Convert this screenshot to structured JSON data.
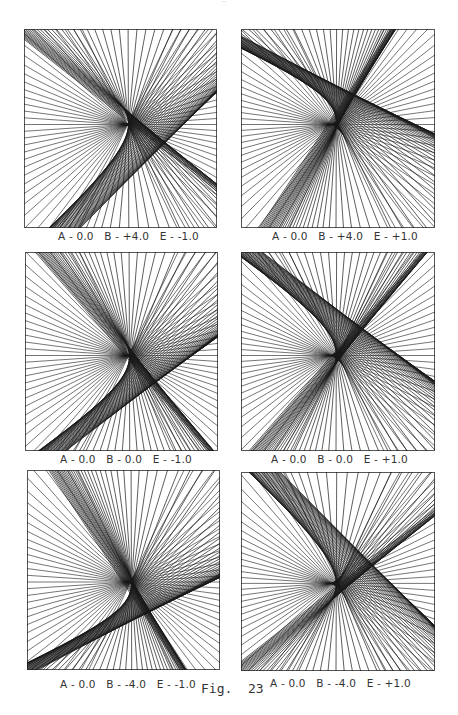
{
  "page_mark": "··",
  "figure_label": "Fig.  23",
  "line_color": "#1a1a1a",
  "panels": [
    {
      "caption": "A - 0.0   B - +4.0   E - -1.0",
      "A": 0.0,
      "B": 4.0,
      "E": -1.0
    },
    {
      "caption": "A - 0.0   B - +4.0   E - +1.0",
      "A": 0.0,
      "B": 4.0,
      "E": 1.0
    },
    {
      "caption": "A - 0.0   B - 0.0   E - -1.0",
      "A": 0.0,
      "B": 0.0,
      "E": -1.0
    },
    {
      "caption": "A - 0.0   B - 0.0   E - +1.0",
      "A": 0.0,
      "B": 0.0,
      "E": 1.0
    },
    {
      "caption": "A - 0.0   B - -4.0   E - -1.0",
      "A": 0.0,
      "B": -4.0,
      "E": -1.0
    },
    {
      "caption": "A - 0.0   B - -4.0   E - +1.0",
      "A": 0.0,
      "B": -4.0,
      "E": 1.0
    }
  ]
}
